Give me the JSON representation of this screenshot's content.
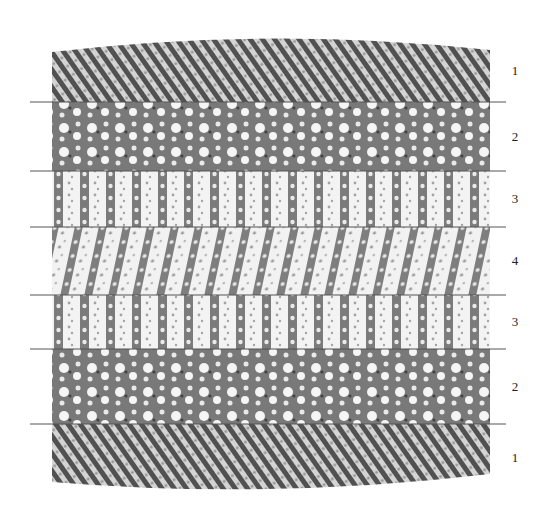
{
  "figure": {
    "colors": {
      "atom_dark": "#3a3a3a",
      "atom_mid": "#7a7a7a",
      "atom_light": "#bdbdbd",
      "boundary_line": "#555555"
    },
    "layers": [
      {
        "label": "1",
        "kind": "crystal"
      },
      {
        "label": "2",
        "kind": "porous"
      },
      {
        "label": "3",
        "kind": "chains"
      },
      {
        "label": "4",
        "kind": "mixed"
      },
      {
        "label": "3",
        "kind": "chains"
      },
      {
        "label": "2",
        "kind": "porous"
      },
      {
        "label": "1",
        "kind": "crystal"
      }
    ]
  }
}
